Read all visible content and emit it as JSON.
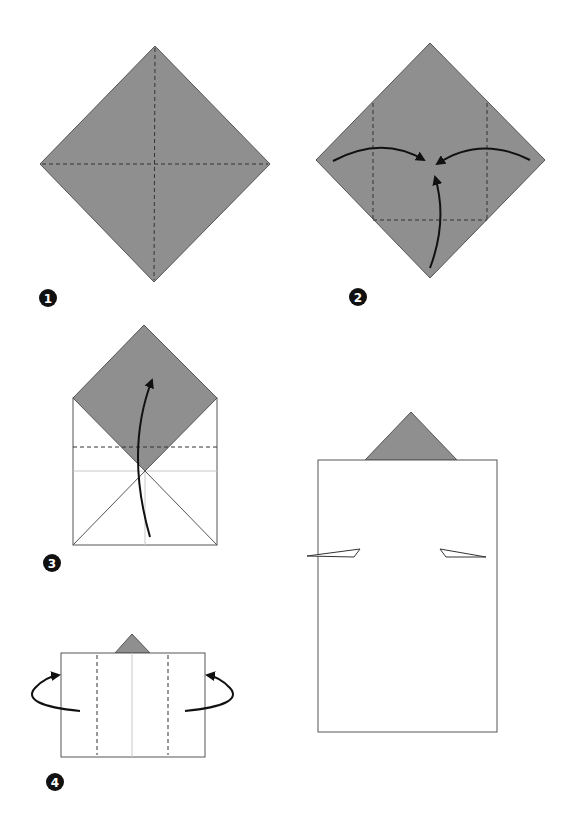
{
  "colors": {
    "paper_colored": "#8f8f8f",
    "paper_white": "#ffffff",
    "outline": "#555555",
    "fold_line": "#444444",
    "crease_light": "#c8c8c8",
    "arrow": "#111111",
    "badge": "#111111"
  },
  "steps": [
    {
      "number": "1",
      "description": "Square diamond, colored side up, with valley creases along both diagonals"
    },
    {
      "number": "2",
      "description": "Fold left, right and bottom corners to the center"
    },
    {
      "number": "3",
      "description": "Fold the bottom part up along the dashed line"
    },
    {
      "number": "4",
      "description": "Fold both sides behind along the dashed lines"
    },
    {
      "number": "",
      "description": "Finished model"
    }
  ]
}
